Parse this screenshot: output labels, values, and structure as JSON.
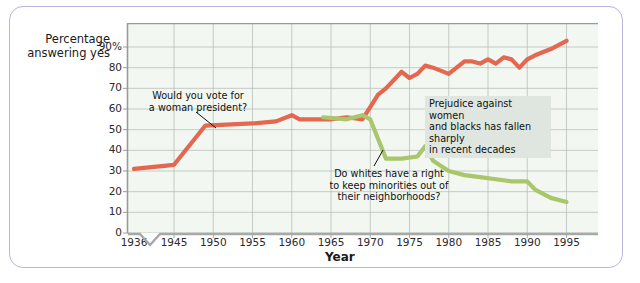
{
  "figure": {
    "ylabel_line1": "Percentage",
    "ylabel_line2": "answering yes",
    "xlabel": "Year",
    "frame_color": "#b9b6dd",
    "plot_bg": "#f2f7f2"
  },
  "annotations": [
    {
      "id": "women-president",
      "line1": "Would you vote for",
      "line2": "a woman president?",
      "boxed": false
    },
    {
      "id": "white-neighborhoods",
      "line1": "Do whites have a right",
      "line2": "to keep minorities out of",
      "line3": "their neighborhoods?",
      "boxed": false
    },
    {
      "id": "prejudice-summary",
      "line1": "Prejudice against women",
      "line2": "and blacks has fallen sharply",
      "line3": "in recent decades",
      "boxed": true
    }
  ],
  "chart_data": {
    "type": "line",
    "title": "",
    "xlabel": "Year",
    "ylabel": "Percentage answering yes",
    "xlim": [
      1936,
      1997
    ],
    "ylim": [
      0,
      95
    ],
    "ytick_labels": [
      "0",
      "10",
      "20",
      "30",
      "40",
      "50",
      "60",
      "70",
      "80",
      "90%"
    ],
    "ytick_values": [
      0,
      10,
      20,
      30,
      40,
      50,
      60,
      70,
      80,
      90
    ],
    "xtick_labels": [
      "1936",
      "1945",
      "1950",
      "1955",
      "1960",
      "1965",
      "1970",
      "1975",
      "1980",
      "1985",
      "1990",
      "1995"
    ],
    "xtick_values": [
      1936,
      1945,
      1950,
      1955,
      1960,
      1965,
      1970,
      1975,
      1980,
      1985,
      1990,
      1995
    ],
    "axis_break": true,
    "grid": true,
    "legend": "none",
    "series": [
      {
        "name": "Would you vote for a woman president?",
        "color": "#e4674f",
        "x": [
          1936,
          1945,
          1949,
          1955,
          1958,
          1960,
          1961,
          1963,
          1965,
          1967,
          1969,
          1971,
          1972,
          1974,
          1975,
          1976,
          1977,
          1978,
          1980,
          1982,
          1983,
          1984,
          1985,
          1986,
          1987,
          1988,
          1989,
          1990,
          1991,
          1993,
          1995
        ],
        "values": [
          31,
          33,
          52,
          53,
          54,
          57,
          55,
          55,
          55,
          56,
          55,
          67,
          70,
          78,
          75,
          77,
          81,
          80,
          77,
          83,
          83,
          82,
          84,
          82,
          85,
          84,
          80,
          84,
          86,
          89,
          93
        ]
      },
      {
        "name": "Do whites have a right to keep minorities out of their neighborhoods?",
        "color": "#a9c66a",
        "x": [
          1964,
          1967,
          1969,
          1970,
          1972,
          1974,
          1976,
          1977,
          1978,
          1980,
          1982,
          1984,
          1986,
          1988,
          1990,
          1991,
          1993,
          1995
        ],
        "values": [
          56,
          55,
          57,
          55,
          36,
          36,
          37,
          42,
          35,
          30,
          28,
          27,
          26,
          25,
          25,
          21,
          17,
          15
        ]
      }
    ]
  }
}
